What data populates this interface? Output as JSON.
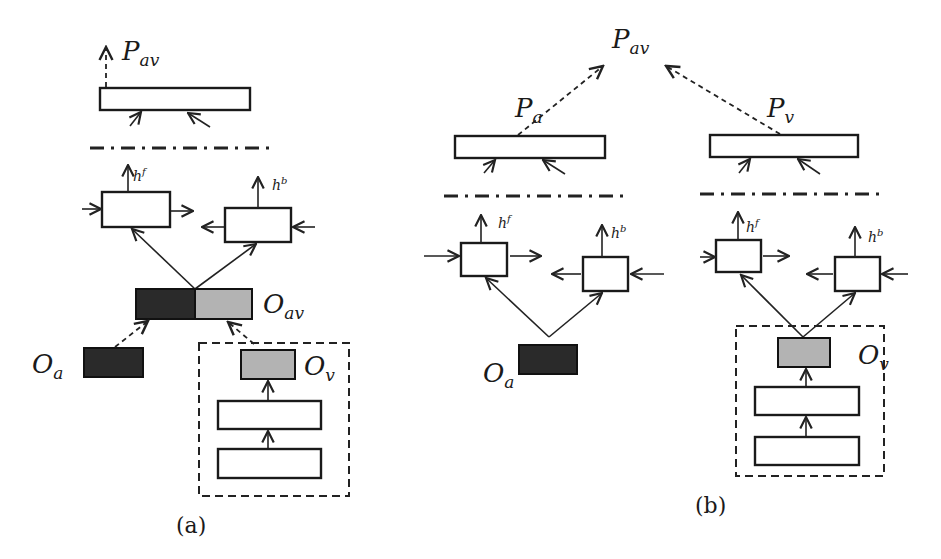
{
  "diagram": {
    "type": "neural-architecture-comparison",
    "panel_a": {
      "caption": "(a)",
      "output": {
        "main": "P",
        "sub": "av"
      },
      "lstm_forward_label": {
        "main": "h",
        "sup": "f"
      },
      "lstm_backward_label": {
        "main": "h",
        "sup": "b"
      },
      "fused_feature": {
        "main": "O",
        "sub": "av"
      },
      "audio_feature": {
        "main": "O",
        "sub": "a"
      },
      "visual_feature": {
        "main": "O",
        "sub": "v"
      }
    },
    "panel_b": {
      "caption": "(b)",
      "output": {
        "main": "P",
        "sub": "av"
      },
      "audio_prediction": {
        "main": "P",
        "sub": "a"
      },
      "visual_prediction": {
        "main": "P",
        "sub": "v"
      },
      "audio_lstm_forward_label": {
        "main": "h",
        "sup": "f"
      },
      "audio_lstm_backward_label": {
        "main": "h",
        "sup": "b"
      },
      "visual_lstm_forward_label": {
        "main": "h",
        "sup": "f"
      },
      "visual_lstm_backward_label": {
        "main": "h",
        "sup": "b"
      },
      "audio_feature": {
        "main": "O",
        "sub": "a"
      },
      "visual_feature": {
        "main": "O",
        "sub": "v"
      }
    },
    "colors": {
      "audio_feature": "#2a2a2a",
      "visual_feature": "#b3b3b3",
      "stroke": "#1a1a1a",
      "background": "#ffffff"
    }
  }
}
